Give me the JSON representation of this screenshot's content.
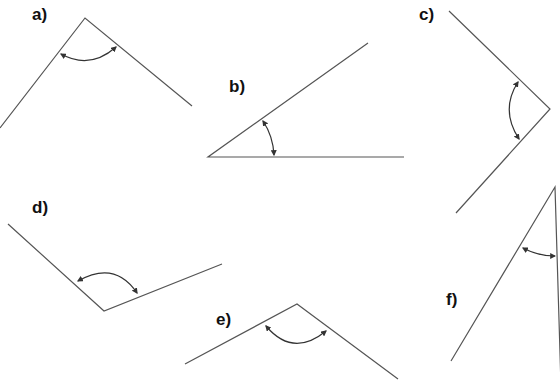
{
  "figures": [
    {
      "label": "a)"
    },
    {
      "label": "b)"
    },
    {
      "label": "c)"
    },
    {
      "label": "d)"
    },
    {
      "label": "e)"
    },
    {
      "label": "f)"
    }
  ],
  "colors": {
    "line": "#555555",
    "arc": "#333333",
    "label": "#111111",
    "background": "#ffffff"
  }
}
